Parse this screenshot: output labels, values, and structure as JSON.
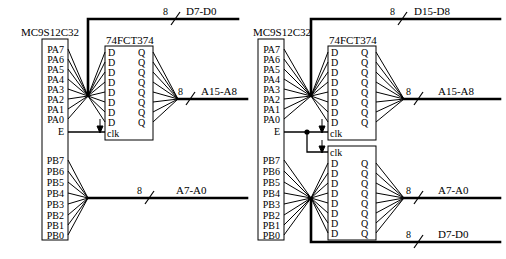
{
  "figure": {
    "type": "circuit-schematic",
    "panel_count": 2
  },
  "panels": [
    {
      "id": "left",
      "name": "narrow-bus-8-bit-configuration",
      "mcu": {
        "label": "MC9S12C32",
        "port_a_pins": [
          "PA7",
          "PA6",
          "PA5",
          "PA4",
          "PA3",
          "PA2",
          "PA1",
          "PA0"
        ],
        "clock_pin": "E",
        "port_b_pins": [
          "PB7",
          "PB6",
          "PB5",
          "PB4",
          "PB3",
          "PB2",
          "PB1",
          "PB0"
        ]
      },
      "latches": [
        {
          "id": "left-latch-1",
          "label": "74FCT374",
          "clk_label": "clk",
          "clk_position": "bottom",
          "d_labels": [
            "D",
            "D",
            "D",
            "D",
            "D",
            "D",
            "D",
            "D"
          ],
          "q_labels": [
            "Q",
            "Q",
            "Q",
            "Q",
            "Q",
            "Q",
            "Q",
            "Q"
          ]
        }
      ],
      "buses": [
        {
          "id": "left-bus-data",
          "label": "D7-D0",
          "width": "8",
          "source": "port-a-direct"
        },
        {
          "id": "left-bus-addr-hi",
          "label": "A15-A8",
          "width": "8",
          "source": "latch-q-outputs"
        },
        {
          "id": "left-bus-addr-lo",
          "label": "A7-A0",
          "width": "8",
          "source": "port-b-direct"
        }
      ]
    },
    {
      "id": "right",
      "name": "wide-bus-16-bit-configuration",
      "mcu": {
        "label": "MC9S12C32",
        "port_a_pins": [
          "PA7",
          "PA6",
          "PA5",
          "PA4",
          "PA3",
          "PA2",
          "PA1",
          "PA0"
        ],
        "clock_pin": "E",
        "port_b_pins": [
          "PB7",
          "PB6",
          "PB5",
          "PB4",
          "PB3",
          "PB2",
          "PB1",
          "PB0"
        ]
      },
      "latches": [
        {
          "id": "right-latch-1",
          "label": "74FCT374",
          "clk_label": "clk",
          "clk_position": "bottom",
          "d_labels": [
            "D",
            "D",
            "D",
            "D",
            "D",
            "D",
            "D",
            "D"
          ],
          "q_labels": [
            "Q",
            "Q",
            "Q",
            "Q",
            "Q",
            "Q",
            "Q",
            "Q"
          ]
        },
        {
          "id": "right-latch-2",
          "label": "",
          "clk_label": "clk",
          "clk_position": "top",
          "d_labels": [
            "D",
            "D",
            "D",
            "D",
            "D",
            "D",
            "D",
            "D"
          ],
          "q_labels": [
            "Q",
            "Q",
            "Q",
            "Q",
            "Q",
            "Q",
            "Q",
            "Q"
          ]
        }
      ],
      "buses": [
        {
          "id": "right-bus-data-hi",
          "label": "D15-D8",
          "width": "8",
          "source": "port-a-direct"
        },
        {
          "id": "right-bus-addr-hi",
          "label": "A15-A8",
          "width": "8",
          "source": "latch-1-q-outputs"
        },
        {
          "id": "right-bus-addr-lo",
          "label": "A7-A0",
          "width": "8",
          "source": "latch-2-q-outputs"
        },
        {
          "id": "right-bus-data-lo",
          "label": "D7-D0",
          "width": "8",
          "source": "port-b-direct"
        }
      ]
    }
  ],
  "colors": {
    "ink": "#000000",
    "paper": "#ffffff"
  }
}
